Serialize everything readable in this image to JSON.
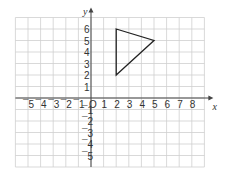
{
  "chart_data": {
    "type": "scatter",
    "title": "",
    "xlabel": "x",
    "ylabel": "y",
    "xlim": [
      -6,
      9
    ],
    "ylim": [
      -6,
      7
    ],
    "grid": true,
    "x_ticks": [
      "-5",
      "-4",
      "-3",
      "-2",
      "-1",
      "O",
      "1",
      "2",
      "3",
      "4",
      "5",
      "6",
      "7",
      "8"
    ],
    "y_ticks": [
      "6",
      "5",
      "4",
      "3",
      "2",
      "1",
      "-1",
      "-2",
      "-3",
      "-4",
      "-5"
    ],
    "shapes": [
      {
        "name": "triangle",
        "vertices": [
          [
            2,
            6
          ],
          [
            5,
            5
          ],
          [
            2,
            2
          ]
        ]
      }
    ],
    "origin_label": "O"
  }
}
